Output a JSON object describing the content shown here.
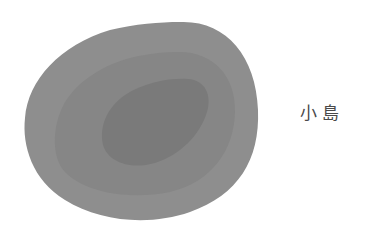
{
  "figure": {
    "label": "小島",
    "colors": {
      "background": "#ffffff",
      "outer": "#8e8e8e",
      "middle": "#868686",
      "inner": "#7a7a7a",
      "label": "#4a4a4a"
    },
    "layers": [
      {
        "name": "outer-contour",
        "shade": "light"
      },
      {
        "name": "middle-contour",
        "shade": "medium"
      },
      {
        "name": "inner-contour",
        "shade": "dark"
      }
    ]
  }
}
